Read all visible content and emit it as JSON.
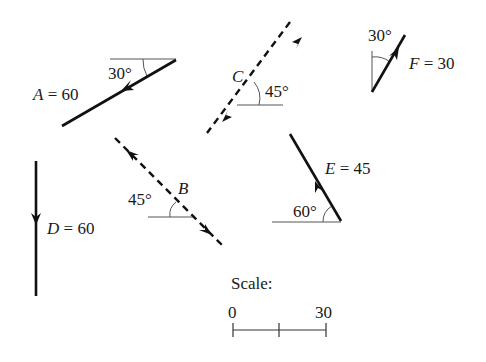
{
  "diagram": {
    "vectors": [
      {
        "id": "A",
        "label": "A = 60",
        "name": "A",
        "magnitude": "60",
        "angle": "30°",
        "style": "solid"
      },
      {
        "id": "B",
        "label": "B",
        "name": "B",
        "magnitude": "",
        "angle": "45°",
        "style": "dashed"
      },
      {
        "id": "C",
        "label": "C",
        "name": "C",
        "magnitude": "",
        "angle": "45°",
        "style": "dashed"
      },
      {
        "id": "D",
        "label": "D = 60",
        "name": "D",
        "magnitude": "60",
        "angle": "",
        "style": "solid"
      },
      {
        "id": "E",
        "label": "E = 45",
        "name": "E",
        "magnitude": "45",
        "angle": "60°",
        "style": "solid"
      },
      {
        "id": "F",
        "label": "F = 30",
        "name": "F",
        "magnitude": "30",
        "angle": "30°",
        "style": "solid"
      }
    ],
    "scale": {
      "title": "Scale:",
      "start": "0",
      "end": "30"
    },
    "colors": {
      "line": "#111111",
      "reference": "#555555"
    }
  }
}
